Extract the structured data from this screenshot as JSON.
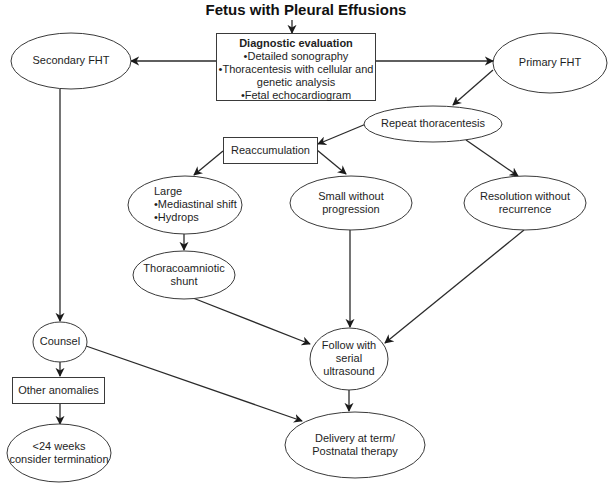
{
  "title": "Fetus with Pleural Effusions",
  "nodes": {
    "diagnostic": {
      "heading": "Diagnostic evaluation",
      "items": [
        "•Detailed sonography",
        "•Thoracentesis with cellular and",
        "genetic analysis",
        "•Fetal echocardiogram"
      ]
    },
    "secondary_fht": {
      "label": "Secondary FHT"
    },
    "primary_fht": {
      "label": "Primary FHT"
    },
    "repeat_thoracentesis": {
      "label": "Repeat thoracentesis"
    },
    "reaccumulation": {
      "label": "Reaccumulation"
    },
    "large": {
      "heading": "Large",
      "items": [
        "•Mediastinal shift",
        "•Hydrops"
      ]
    },
    "small": {
      "lines": [
        "Small without",
        "progression"
      ]
    },
    "resolution": {
      "lines": [
        "Resolution without",
        "recurrence"
      ]
    },
    "shunt": {
      "lines": [
        "Thoracoamniotic",
        "shunt"
      ]
    },
    "follow": {
      "lines": [
        "Follow with",
        "serial",
        "ultrasound"
      ]
    },
    "counsel": {
      "label": "Counsel"
    },
    "other_anomalies": {
      "label": "Other anomalies"
    },
    "termination": {
      "lines": [
        "<24 weeks",
        "consider termination"
      ]
    },
    "delivery": {
      "lines": [
        "Delivery at term/",
        "Postnatal therapy"
      ]
    }
  }
}
